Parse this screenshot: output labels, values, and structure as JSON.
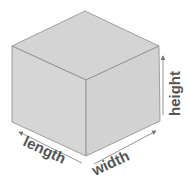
{
  "diagram": {
    "labels": {
      "length": "length",
      "width": "width",
      "height": "height"
    },
    "colors": {
      "top_face": "#d4d4d4",
      "left_face": "#d6d6d6",
      "right_face": "#d2d2d2",
      "edge": "#8a8a8a",
      "arrow": "#777777",
      "text": "#555555"
    }
  }
}
